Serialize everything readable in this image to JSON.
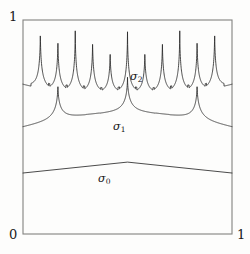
{
  "figure": {
    "background_color": "#fdfdfc",
    "frame_color": "#7a7a78",
    "curve_color": "#262626"
  },
  "axes": {
    "y_top_label": "1",
    "y_bottom_label": "0",
    "x_right_label": "1",
    "x_left_label": "0",
    "frame": {
      "left": 23,
      "top": 20,
      "right": 232,
      "bottom": 234
    },
    "xlim": [
      0,
      1
    ],
    "ylim": [
      0,
      1
    ],
    "grid": false
  },
  "labels": {
    "sigma2": {
      "base": "σ",
      "sub": "2"
    },
    "sigma1": {
      "base": "σ",
      "sub": "1"
    },
    "sigma0": {
      "base": "σ",
      "sub": "0"
    }
  },
  "chart_data": {
    "type": "line",
    "title": "",
    "xlabel": "",
    "ylabel": "",
    "xlim": [
      0,
      1
    ],
    "ylim": [
      0,
      1
    ],
    "xticks": [
      0,
      1
    ],
    "xticklabels": [
      "0",
      "1"
    ],
    "yticks": [
      0,
      1
    ],
    "yticklabels": [
      "0",
      "1"
    ],
    "grid": false,
    "legend": "inline-annotations",
    "series": [
      {
        "name": "σ₀",
        "label": "sigma_0",
        "kind": "tent",
        "points": [
          {
            "x": 0.0,
            "y": 0.285
          },
          {
            "x": 0.5,
            "y": 0.336
          },
          {
            "x": 1.0,
            "y": 0.285
          }
        ]
      },
      {
        "name": "σ₁",
        "label": "sigma_1",
        "kind": "cusped",
        "spike_positions": [
          0.167,
          0.5,
          0.833
        ],
        "spike_heights": [
          0.74,
          0.74,
          0.74
        ],
        "baseline_points": [
          {
            "x": 0.0,
            "y": 0.505
          },
          {
            "x": 0.083,
            "y": 0.565
          },
          {
            "x": 0.167,
            "y": 0.74
          },
          {
            "x": 0.26,
            "y": 0.565
          },
          {
            "x": 0.38,
            "y": 0.505
          },
          {
            "x": 0.5,
            "y": 0.74
          },
          {
            "x": 0.62,
            "y": 0.505
          },
          {
            "x": 0.74,
            "y": 0.565
          },
          {
            "x": 0.833,
            "y": 0.74
          },
          {
            "x": 0.917,
            "y": 0.565
          },
          {
            "x": 1.0,
            "y": 0.505
          }
        ]
      },
      {
        "name": "σ₂",
        "label": "sigma_2",
        "kind": "cusped",
        "spike_positions": [
          0.083,
          0.167,
          0.25,
          0.333,
          0.417,
          0.5,
          0.583,
          0.667,
          0.75,
          0.833,
          0.917
        ],
        "spike_heights": [
          0.925,
          0.9,
          0.945,
          0.905,
          0.855,
          0.945,
          0.855,
          0.905,
          0.945,
          0.9,
          0.925
        ],
        "valley_level": 0.66,
        "edge_level": 0.7
      }
    ]
  }
}
